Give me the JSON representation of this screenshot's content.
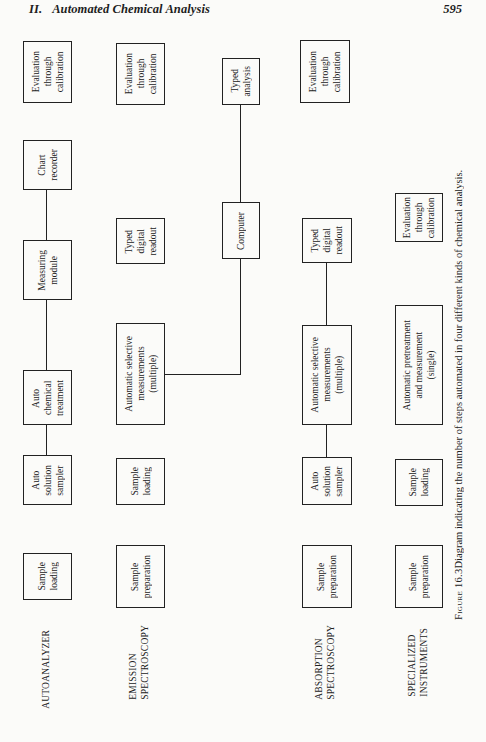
{
  "header": {
    "section_number": "II.",
    "section_title": "Automated Chemical Analysis",
    "page_number": "595"
  },
  "rows": [
    {
      "label": "AUTOANALYZER",
      "steps": [
        "Sample\nloading",
        "Auto\nsolution\nsampler",
        "Auto\nchemical\ntreatment",
        "Measuring\nmodule",
        "Chart\nrecorder",
        "Evaluation\nthrough\ncalibration"
      ]
    },
    {
      "label": "EMISSION\nSPECTROSCOPY",
      "steps": [
        "Sample\npreparation",
        "Sample\nloading",
        "Automatic selective\nmeasurements\n(multiple)",
        "Typed\ndigital\nreadout",
        "Evaluation\nthrough\ncalibration"
      ]
    },
    {
      "label": "ABSORPTION\nSPECTROSCOPY",
      "steps": [
        "Sample\npreparation",
        "Auto\nsolution\nsampler",
        "Automatic selective\nmeasurements\n(multiple)",
        "Typed\ndigital\nreadout",
        "Evaluation\nthrough\ncalibration"
      ]
    },
    {
      "label": "SPECIALIZED\nINSTRUMENTS",
      "steps": [
        "Sample\npreparation",
        "Sample\nloading",
        "Automatic pretreatment\nand measurement\n(single)",
        "Evaluation\nthrough\ncalibration"
      ]
    }
  ],
  "shared": {
    "computer": "Computer",
    "typed_analysis": "Typed\nanalysis"
  },
  "caption": {
    "figure_label": "Figure 16.3",
    "text": "Diagram indicating the number of steps automated in four different kinds of chemical analysis."
  }
}
